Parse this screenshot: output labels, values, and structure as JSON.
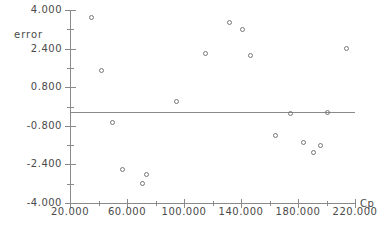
{
  "chart_data": {
    "type": "scatter",
    "title": "",
    "xlabel": "Cp",
    "ylabel": "error",
    "xlim": [
      20.0,
      220.0
    ],
    "ylim": [
      -4.0,
      4.0
    ],
    "grid": false,
    "legend": null,
    "x_ticks_major": [
      "20.000",
      "60.000",
      "100.000",
      "140.000",
      "180.000",
      "220.000"
    ],
    "x_tick_major_values": [
      20,
      60,
      100,
      140,
      180,
      220
    ],
    "x_tick_minor_values": [
      40,
      80,
      120,
      160,
      200
    ],
    "y_ticks_major": [
      "4.000",
      "2.400",
      "0.800",
      "-0.800",
      "-2.400",
      "-4.000"
    ],
    "y_tick_major_values": [
      4.0,
      2.4,
      0.8,
      -0.8,
      -2.4,
      -4.0
    ],
    "y_tick_minor_values": [
      3.2,
      1.6,
      0.0,
      -1.6,
      -3.2
    ],
    "reference_line_y": 0.0,
    "series": [
      {
        "name": "error",
        "marker": "open-circle",
        "points": [
          {
            "x": 35.0,
            "y": 3.7
          },
          {
            "x": 42.0,
            "y": 1.5
          },
          {
            "x": 50.0,
            "y": -0.65
          },
          {
            "x": 57.0,
            "y": -2.6
          },
          {
            "x": 71.0,
            "y": -3.2
          },
          {
            "x": 74.0,
            "y": -2.8
          },
          {
            "x": 95.0,
            "y": 0.2
          },
          {
            "x": 115.0,
            "y": 2.2
          },
          {
            "x": 132.0,
            "y": 3.5
          },
          {
            "x": 141.0,
            "y": 3.2
          },
          {
            "x": 147.0,
            "y": 2.1
          },
          {
            "x": 164.0,
            "y": -1.2
          },
          {
            "x": 175.0,
            "y": -0.3
          },
          {
            "x": 184.0,
            "y": -1.5
          },
          {
            "x": 191.0,
            "y": -1.9
          },
          {
            "x": 196.0,
            "y": -1.6
          },
          {
            "x": 201.0,
            "y": -0.25
          },
          {
            "x": 214.0,
            "y": 2.4
          }
        ]
      }
    ]
  },
  "colors": {
    "axis": "#8a8a8a",
    "text": "#4a4a4a",
    "marker": "#777777",
    "background": "#ffffff"
  }
}
